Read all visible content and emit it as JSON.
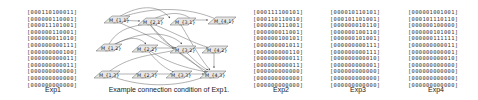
{
  "panels": [
    {
      "caption": "Exp1",
      "rows": [
        "000110100011",
        "000000110001",
        "000011101001",
        "000000110001",
        "000000011010",
        "000000000111",
        "000000000100",
        "000000000011",
        "000000000011",
        "000000000000",
        "000000000000",
        "000000000000"
      ]
    },
    {
      "caption": "Exp2",
      "rows": [
        "000111100101",
        "000110110010",
        "000000111001",
        "000000011001",
        "000000100101",
        "000000001011",
        "000000000110",
        "000000000011",
        "000000000011",
        "000000000000",
        "000000000000",
        "000000000000"
      ]
    },
    {
      "caption": "Exp3",
      "rows": [
        "000010110101",
        "000101101001",
        "000000010110",
        "000000100110",
        "000000101001",
        "000000000111",
        "000000000111",
        "000000000010",
        "000000000001",
        "000000000000",
        "000000000000",
        "000000000000"
      ]
    },
    {
      "caption": "Exp4",
      "rows": [
        "000001001001",
        "000101110110",
        "000000100000",
        "000000101001",
        "000000111111",
        "000000000011",
        "000000000001",
        "000000000010",
        "000000000000",
        "000000000000",
        "000000000000",
        "000000000000"
      ]
    }
  ],
  "diagram": {
    "caption": "Example connection condition of Exp1.",
    "nodes": [
      {
        "label": "M_{1,1}"
      },
      {
        "label": "M_{2,1}"
      },
      {
        "label": "M_{3,1}"
      },
      {
        "label": "M_{4,1}"
      },
      {
        "label": "M_{1,2}"
      },
      {
        "label": "M_{2,2}"
      },
      {
        "label": "M_{3,2}"
      },
      {
        "label": "M_{4,2}"
      },
      {
        "label": "M_{1,3}"
      },
      {
        "label": "M_{2,3}"
      },
      {
        "label": "M_{3,3}"
      },
      {
        "label": "M_{4,3}"
      }
    ]
  }
}
